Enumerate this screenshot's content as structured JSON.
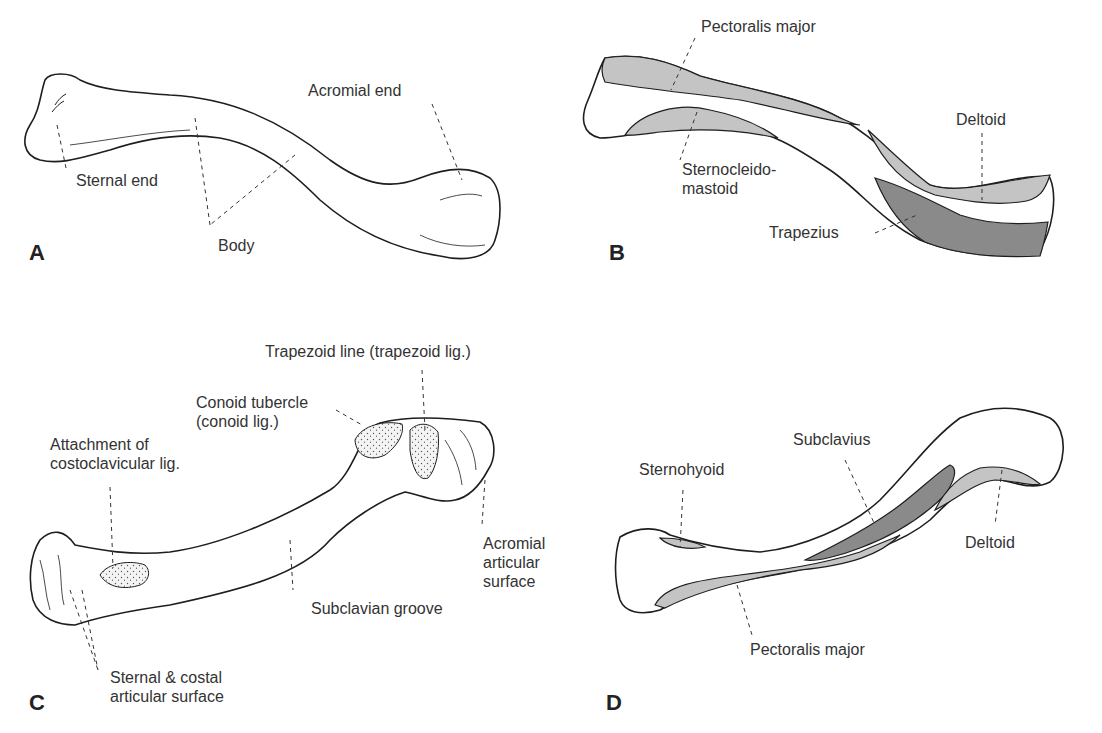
{
  "figure": {
    "colors": {
      "outline": "#1e1e1e",
      "muscle_light": "#c4c4c4",
      "muscle_dark": "#8a8a8a",
      "bone_fill": "#ffffff",
      "label_text": "#333333"
    }
  },
  "panels": [
    {
      "letter": "A",
      "labels": [
        {
          "text": "Sternal end"
        },
        {
          "text": "Body"
        },
        {
          "text": "Acromial end"
        }
      ]
    },
    {
      "letter": "B",
      "labels": [
        {
          "text": "Pectoralis major"
        },
        {
          "text": "Sternocleido-\nmastoid"
        },
        {
          "text": "Deltoid"
        },
        {
          "text": "Trapezius"
        }
      ]
    },
    {
      "letter": "C",
      "labels": [
        {
          "text": "Trapezoid line (trapezoid lig.)"
        },
        {
          "text": "Conoid tubercle\n(conoid lig.)"
        },
        {
          "text": "Attachment of\ncostoclavicular lig."
        },
        {
          "text": "Acromial\narticular\nsurface"
        },
        {
          "text": "Subclavian groove"
        },
        {
          "text": "Sternal & costal\narticular surface"
        }
      ]
    },
    {
      "letter": "D",
      "labels": [
        {
          "text": "Subclavius"
        },
        {
          "text": "Sternohyoid"
        },
        {
          "text": "Deltoid"
        },
        {
          "text": "Pectoralis major"
        }
      ]
    }
  ]
}
